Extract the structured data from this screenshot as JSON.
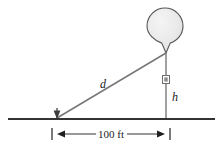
{
  "figure": {
    "kind": "geometry-diagram",
    "width": 223,
    "height": 148,
    "background_color": "#ffffff"
  },
  "labels": {
    "slant_distance": "d",
    "height": "h",
    "baseline_dimension": "100 ft"
  },
  "colors": {
    "line_stroke": "#4d4d4d",
    "ground_stroke": "#333333",
    "balloon_fill": "#e8e8e8",
    "balloon_stroke": "#555555",
    "text": "#1a1a1a",
    "marker_fill": "#8a8a8a"
  },
  "geometry": {
    "ground_line": {
      "x1": 8,
      "y1": 119,
      "x2": 215,
      "y2": 119
    },
    "observer_point": {
      "x": 57,
      "y": 118
    },
    "balloon_base_point": {
      "x": 166,
      "y": 119
    },
    "balloon_neck_point": {
      "x": 166,
      "y": 53
    },
    "slant_line": {
      "x1": 57,
      "y1": 118,
      "x2": 166,
      "y2": 53
    },
    "vertical_line": {
      "x1": 166,
      "y1": 53,
      "x2": 166,
      "y2": 119
    },
    "balloon_circle": {
      "cx": 165,
      "cy": 26,
      "r": 18
    },
    "angle_marker": {
      "x": 166,
      "y": 80
    },
    "dimension_line": {
      "y": 134,
      "x_left": 52,
      "x_right": 170
    },
    "dimension_ticks": [
      52,
      170
    ],
    "label_positions": {
      "slant_distance": {
        "x": 103,
        "y": 88
      },
      "height": {
        "x": 174,
        "y": 100
      },
      "baseline_dimension": {
        "x": 111,
        "y": 138
      }
    }
  }
}
